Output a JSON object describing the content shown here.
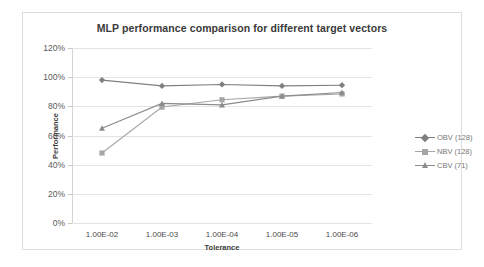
{
  "chart_data": {
    "type": "line",
    "title": "MLP performance comparison for different target vectors",
    "xlabel": "Tolerance",
    "ylabel": "Performance",
    "categories": [
      "1.00E-02",
      "1.00E-03",
      "1.00E-04",
      "1.00E-05",
      "1.00E-06"
    ],
    "ylim": [
      0,
      120
    ],
    "ytick_labels": [
      "0%",
      "20%",
      "40%",
      "60%",
      "80%",
      "100%",
      "120%"
    ],
    "ytick_values": [
      0,
      20,
      40,
      60,
      80,
      100,
      120
    ],
    "grid": true,
    "legend_position": "right",
    "series": [
      {
        "name": "OBV (128)",
        "marker": "diamond",
        "color": "#7f7f7f",
        "values": [
          98,
          94,
          95,
          94,
          94.5
        ]
      },
      {
        "name": "NBV (128)",
        "marker": "square",
        "color": "#a6a6a6",
        "values": [
          48,
          79.5,
          84.5,
          87,
          88.5
        ]
      },
      {
        "name": "CBV (71)",
        "marker": "triangle",
        "color": "#8c8c8c",
        "values": [
          65,
          82,
          81,
          87,
          89.5
        ]
      }
    ]
  },
  "colors": {
    "frame_border": "#dddddd",
    "gridline": "#e4e4e4",
    "axis": "#d4d4d4",
    "title_text": "#3a3a3a",
    "tick_text": "#5a5a5a",
    "legend_text": "#777777",
    "background": "#ffffff"
  }
}
